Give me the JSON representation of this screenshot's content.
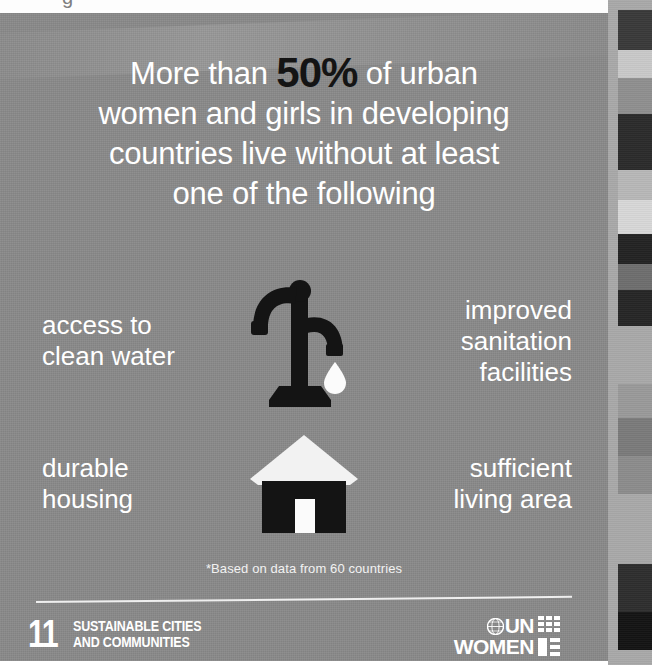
{
  "poster": {
    "background_color": "#8a8a8a",
    "headline": {
      "line1_pre": "More than ",
      "stat": "50%",
      "line1_post": " of urban",
      "line2": "women and girls in developing",
      "line3": "countries live without at least",
      "line4": "one of the following",
      "text_color": "#ffffff",
      "stat_color": "#141414"
    },
    "features": [
      {
        "id": "water",
        "icon": "water-pump-icon",
        "left_label_line1": "access to",
        "left_label_line2": "clean water",
        "right_label_line1": "improved",
        "right_label_line2": "sanitation",
        "right_label_line3": "facilities"
      },
      {
        "id": "housing",
        "icon": "house-icon",
        "left_label_line1": "durable",
        "left_label_line2": "housing",
        "right_label_line1": "sufficient",
        "right_label_line2": "living area",
        "right_label_line3": ""
      }
    ],
    "footnote": "*Based on data from 60 countries",
    "footer": {
      "sdg": {
        "number": "11",
        "title_line1": "SUSTAINABLE CITIES",
        "title_line2": "AND COMMUNITIES"
      },
      "unwomen": {
        "line1": "UN",
        "line2": "WOMEN",
        "emblem": "un-emblem-icon",
        "mark": "unwomen-grid-mark-icon"
      }
    }
  },
  "calibration_strip": {
    "background": "#a9a9a9",
    "blocks": [
      {
        "top": 10,
        "height": 40,
        "color": "#3a3a3a"
      },
      {
        "top": 50,
        "height": 28,
        "color": "#c9c9c9"
      },
      {
        "top": 78,
        "height": 36,
        "color": "#8f8f8f"
      },
      {
        "top": 114,
        "height": 56,
        "color": "#2b2b2b"
      },
      {
        "top": 170,
        "height": 30,
        "color": "#b8b8b8"
      },
      {
        "top": 200,
        "height": 34,
        "color": "#d8d8d8"
      },
      {
        "top": 234,
        "height": 30,
        "color": "#232323"
      },
      {
        "top": 264,
        "height": 26,
        "color": "#6e6e6e"
      },
      {
        "top": 290,
        "height": 36,
        "color": "#262626"
      },
      {
        "top": 326,
        "height": 58,
        "color": "#a9a9a9"
      },
      {
        "top": 384,
        "height": 34,
        "color": "#9a9a9a"
      },
      {
        "top": 418,
        "height": 38,
        "color": "#7b7b7b"
      },
      {
        "top": 456,
        "height": 38,
        "color": "#8c8c8c"
      },
      {
        "top": 494,
        "height": 70,
        "color": "#a9a9a9"
      },
      {
        "top": 564,
        "height": 48,
        "color": "#2e2e2e"
      },
      {
        "top": 612,
        "height": 38,
        "color": "#141414"
      }
    ]
  },
  "scan": {
    "top_margin_color": "#fdfdfd",
    "clipped_glyph": "g"
  }
}
